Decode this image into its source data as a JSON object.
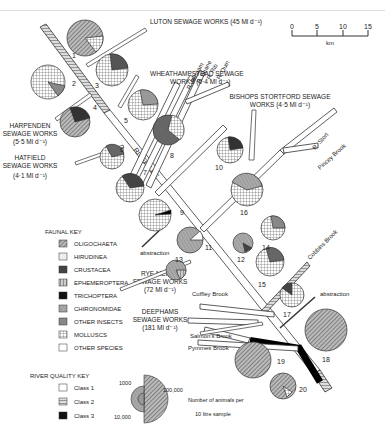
{
  "scale_bar": {
    "ticks": [
      "0",
      "5",
      "10",
      "15"
    ],
    "unit": "km"
  },
  "sewage_works": [
    {
      "id": "luton",
      "label": "LUTON SEWAGE WORKS (45 Ml d⁻¹)"
    },
    {
      "id": "wheathampstead",
      "line1": "WHEATHAMPSTEAD SEWAGE",
      "line2": "WORKS (0·4 Ml d⁻¹)"
    },
    {
      "id": "harpenden",
      "line1": "HARPENDEN",
      "line2": "SEWAGE WORKS",
      "line3": "(5·5 Ml d⁻¹)"
    },
    {
      "id": "hatfield",
      "line1": "HATFIELD",
      "line2": "SEWAGE WORKS",
      "line3": "(4·1 Ml d⁻¹)"
    },
    {
      "id": "bishops_stortford",
      "line1": "BISHOPS STORTFORD SEWAGE",
      "line2": "WORKS (4·5 Ml d⁻¹)"
    },
    {
      "id": "rye_meads",
      "line1": "RYE MEADS",
      "line2": "SEWAGE WORKS",
      "line3": "(72 Ml d⁻¹)"
    },
    {
      "id": "deephams",
      "line1": "DEEPHAMS",
      "line2": "SEWAGE WORKS",
      "line3": "(181 Ml d⁻¹)"
    }
  ],
  "rivers": {
    "lee": "RIVER LEE",
    "mimram": "R. Mimram",
    "beane": "R. Beane",
    "rib": "R. Rib",
    "quin": "R. Quin",
    "ash": "R. Ash",
    "stort": "R. Stort",
    "pincey": "Pincey Brook",
    "cobbins": "Cobbins Brook",
    "cuffley": "Cuffley Brook",
    "salmons": "Salmon's Brook",
    "pymmes": "Pymmes Brook"
  },
  "abstraction_labels": [
    "abstraction",
    "abstraction"
  ],
  "faunal_key": {
    "title": "FAUNAL KEY",
    "items": [
      {
        "label": "OLIGOCHAETA",
        "pattern": "oligo"
      },
      {
        "label": "HIRUDINEA",
        "pattern": "hiru"
      },
      {
        "label": "CRUSTACEA",
        "pattern": "crust"
      },
      {
        "label": "EPHEMEROPTERA",
        "pattern": "ephem"
      },
      {
        "label": "TRICHOPTERA",
        "pattern": "trich"
      },
      {
        "label": "CHIRONOMIDAE",
        "pattern": "chiro"
      },
      {
        "label": "OTHER INSECTS",
        "pattern": "other_ins"
      },
      {
        "label": "MOLLUSCS",
        "pattern": "moll"
      },
      {
        "label": "OTHER SPECIES",
        "pattern": "other_sp"
      }
    ]
  },
  "river_quality_key": {
    "title": "RIVER QUALITY KEY",
    "items": [
      {
        "label": "Class 1"
      },
      {
        "label": "Class 2"
      },
      {
        "label": "Class 3"
      }
    ]
  },
  "size_key": {
    "values": [
      "1000",
      "100,000",
      "10,000"
    ],
    "caption_line1": "Number of animals per",
    "caption_line2": "10 litre sample"
  },
  "sites": [
    "1",
    "2",
    "3",
    "4",
    "5",
    "6",
    "7",
    "8",
    "9",
    "10",
    "11",
    "12",
    "13",
    "14",
    "15",
    "16",
    "17",
    "18",
    "19",
    "20"
  ]
}
